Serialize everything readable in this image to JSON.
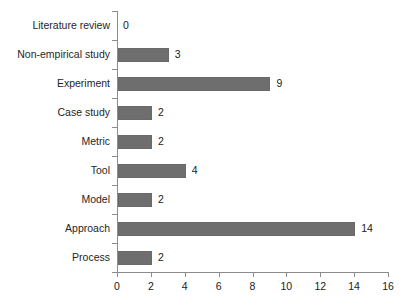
{
  "chart_data": {
    "type": "bar",
    "orientation": "horizontal",
    "title": "",
    "subtitle": "",
    "xlabel": "",
    "ylabel": "",
    "categories": [
      "Literature review",
      "Non-empirical study",
      "Experiment",
      "Case study",
      "Metric",
      "Tool",
      "Model",
      "Approach",
      "Process"
    ],
    "values": [
      0,
      3,
      9,
      2,
      2,
      4,
      2,
      14,
      2
    ],
    "value_labels": [
      "0",
      "3",
      "9",
      "2",
      "2",
      "4",
      "2",
      "14",
      "2"
    ],
    "xlim": [
      0,
      16
    ],
    "xticks": [
      0,
      2,
      4,
      6,
      8,
      10,
      12,
      14,
      16
    ],
    "xtick_labels": [
      "0",
      "2",
      "4",
      "6",
      "8",
      "10",
      "12",
      "14",
      "16"
    ],
    "grid": false,
    "legend": false,
    "legend_position": "none",
    "bar_color": "#6e6e6e",
    "axis_color": "#8c8c8c",
    "text_color": "#1a1a1a",
    "background_color": "#ffffff",
    "data_labels_shown": true
  }
}
